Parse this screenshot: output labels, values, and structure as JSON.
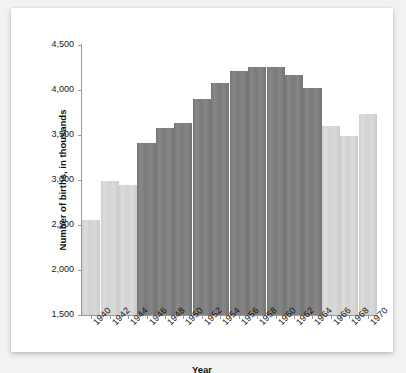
{
  "chart_data": {
    "type": "bar",
    "title": "",
    "xlabel": "Year",
    "ylabel": "Number of births, in thousands",
    "categories": [
      "1940",
      "1941",
      "1942",
      "1943",
      "1944",
      "1945",
      "1946",
      "1947",
      "1948",
      "1949",
      "1950",
      "1951",
      "1952",
      "1953",
      "1954",
      "1955",
      "1956",
      "1957",
      "1958",
      "1959",
      "1960",
      "1961",
      "1962",
      "1963",
      "1964",
      "1965",
      "1966",
      "1967",
      "1968",
      "1969",
      "1970"
    ],
    "tick_labels": [
      "1940",
      "1942",
      "1944",
      "1946",
      "1948",
      "1950",
      "1952",
      "1954",
      "1956",
      "1958",
      "1960",
      "1962",
      "1964",
      "1966",
      "1968",
      "1970"
    ],
    "values": [
      2560,
      2560,
      2990,
      2990,
      2940,
      2940,
      3410,
      3410,
      3580,
      3580,
      3630,
      3630,
      3900,
      3900,
      4080,
      4080,
      4210,
      4210,
      4255,
      4255,
      4255,
      4255,
      4170,
      4170,
      4020,
      4020,
      3600,
      3600,
      3490,
      3490,
      3730
    ],
    "bars": [
      {
        "label": "1940",
        "value": 2560,
        "highlight": false
      },
      {
        "label": "1942",
        "value": 2990,
        "highlight": false
      },
      {
        "label": "1944",
        "value": 2940,
        "highlight": false
      },
      {
        "label": "1946",
        "value": 3410,
        "highlight": true
      },
      {
        "label": "1948",
        "value": 3580,
        "highlight": true
      },
      {
        "label": "1950",
        "value": 3630,
        "highlight": true
      },
      {
        "label": "1952",
        "value": 3900,
        "highlight": true
      },
      {
        "label": "1954",
        "value": 4080,
        "highlight": true
      },
      {
        "label": "1956",
        "value": 4210,
        "highlight": true
      },
      {
        "label": "1958",
        "value": 4255,
        "highlight": true
      },
      {
        "label": "1960",
        "value": 4255,
        "highlight": true
      },
      {
        "label": "1962",
        "value": 4170,
        "highlight": true
      },
      {
        "label": "1964",
        "value": 4020,
        "highlight": true
      },
      {
        "label": "1966",
        "value": 3600,
        "highlight": false
      },
      {
        "label": "1968",
        "value": 3490,
        "highlight": false
      },
      {
        "label": "1970",
        "value": 3730,
        "highlight": false
      }
    ],
    "ylim": [
      1500,
      4500
    ],
    "ytick_values": [
      1500,
      2000,
      2500,
      3000,
      3500,
      4000,
      4500
    ],
    "ytick_labels": [
      "1,500",
      "2,000",
      "2,500",
      "3,000",
      "3,500",
      "4,000",
      "4,500"
    ],
    "grid": false,
    "legend": "none",
    "colors": {
      "highlight_bar": "#7e7e7e",
      "normal_bar": "#d4d4d4",
      "axis": "#9a9a9a",
      "text": "#151515",
      "background": "#ffffff",
      "page_background": "#f2f2f2"
    }
  }
}
